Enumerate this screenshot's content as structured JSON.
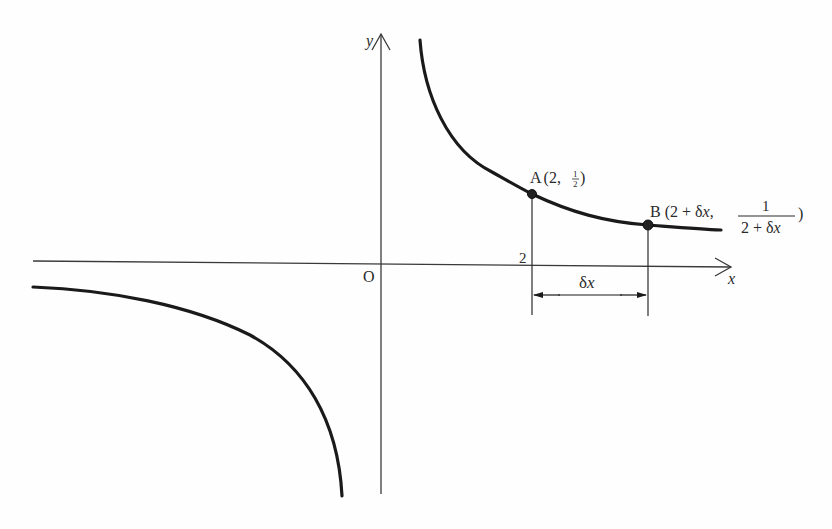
{
  "diagram": {
    "type": "graph-of-function",
    "function": "y = 1/x",
    "axes": {
      "x_label": "x",
      "y_label": "y",
      "origin_label": "O",
      "x_tick_label": "2"
    },
    "points": {
      "A": {
        "name": "A",
        "coords_open": "(2,",
        "frac_num": "1",
        "frac_den": "2",
        "coords_close": ")"
      },
      "B": {
        "name": "B",
        "coords_open": "(2 + δ",
        "coords_x": "x",
        "coords_sep": ",",
        "frac_num": "1",
        "frac_den_pre": "2 + δ",
        "frac_den_x": "x",
        "coords_close": ")"
      }
    },
    "interval": {
      "label_delta": "δ",
      "label_x": "x"
    },
    "colors": {
      "curve": "#1a1a1a",
      "axis": "#3a3a3a",
      "background": "#fefefe"
    }
  }
}
